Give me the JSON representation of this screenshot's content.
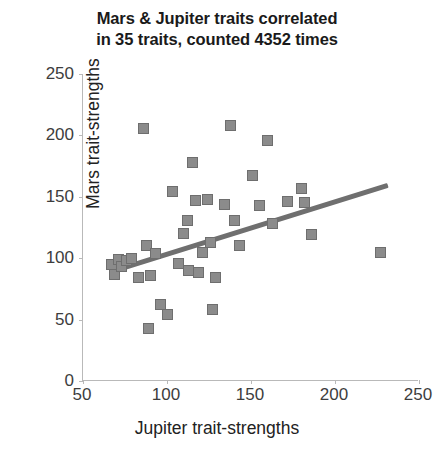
{
  "chart_data": {
    "type": "scatter",
    "title": "Mars & Jupiter traits correlated in 35 traits, counted 4352 times",
    "title_lines": [
      "Mars & Jupiter traits correlated",
      "in 35 traits, counted 4352 times"
    ],
    "xlabel": "Jupiter trait-strengths",
    "ylabel": "Mars trait-strengths",
    "xlim": [
      50,
      250
    ],
    "ylim": [
      0,
      250
    ],
    "xticks": [
      50,
      100,
      150,
      200,
      250
    ],
    "yticks": [
      0,
      50,
      100,
      150,
      200,
      250
    ],
    "grid": false,
    "legend": null,
    "marker_color": "#8b8b8b",
    "marker_edge_color": "#6e6e6e",
    "trendline_color": "#6f6f6f",
    "axis_color": "#b9b9b9",
    "n_points": 40,
    "points": [
      {
        "x": 67,
        "y": 95
      },
      {
        "x": 69,
        "y": 87
      },
      {
        "x": 71,
        "y": 99
      },
      {
        "x": 73,
        "y": 93
      },
      {
        "x": 76,
        "y": 98
      },
      {
        "x": 79,
        "y": 100
      },
      {
        "x": 83,
        "y": 84
      },
      {
        "x": 86,
        "y": 206
      },
      {
        "x": 88,
        "y": 110
      },
      {
        "x": 89,
        "y": 43
      },
      {
        "x": 90,
        "y": 86
      },
      {
        "x": 93,
        "y": 104
      },
      {
        "x": 96,
        "y": 62
      },
      {
        "x": 100,
        "y": 54
      },
      {
        "x": 103,
        "y": 154
      },
      {
        "x": 107,
        "y": 96
      },
      {
        "x": 110,
        "y": 120
      },
      {
        "x": 112,
        "y": 131
      },
      {
        "x": 113,
        "y": 90
      },
      {
        "x": 115,
        "y": 178
      },
      {
        "x": 117,
        "y": 147
      },
      {
        "x": 119,
        "y": 88
      },
      {
        "x": 121,
        "y": 105
      },
      {
        "x": 124,
        "y": 148
      },
      {
        "x": 126,
        "y": 113
      },
      {
        "x": 127,
        "y": 58
      },
      {
        "x": 129,
        "y": 84
      },
      {
        "x": 134,
        "y": 144
      },
      {
        "x": 138,
        "y": 208
      },
      {
        "x": 140,
        "y": 131
      },
      {
        "x": 143,
        "y": 110
      },
      {
        "x": 151,
        "y": 167
      },
      {
        "x": 155,
        "y": 143
      },
      {
        "x": 160,
        "y": 196
      },
      {
        "x": 163,
        "y": 128
      },
      {
        "x": 172,
        "y": 146
      },
      {
        "x": 180,
        "y": 157
      },
      {
        "x": 182,
        "y": 145
      },
      {
        "x": 186,
        "y": 119
      },
      {
        "x": 227,
        "y": 105
      }
    ],
    "trendline": {
      "x_start": 67,
      "y_start": 89,
      "x_end": 231,
      "y_end": 159
    }
  }
}
